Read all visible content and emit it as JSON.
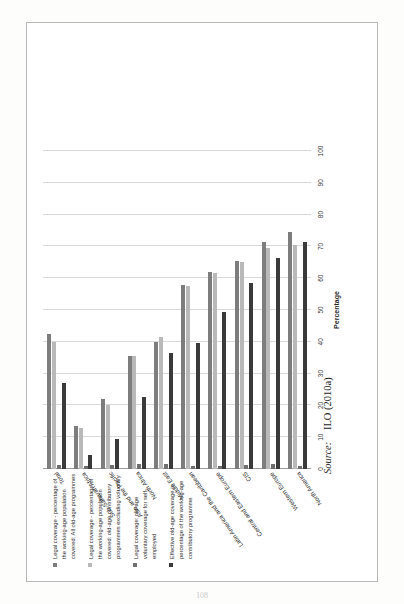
{
  "page": {
    "number": "108"
  },
  "source": {
    "lead": "Source:",
    "value": "ILO (2010a)"
  },
  "legend": {
    "items": [
      {
        "label": "Legal coverage - percentage of the working-age population covered: All old-age programmes",
        "color": "#7d7d7d",
        "name": "legend-item-all-old-age-programmes"
      },
      {
        "label": "Legal coverage - percentage of the working-age population covered: old-age contributory programmes excluding voluntary",
        "color": "#b9b9b9",
        "name": "legend-item-contributory-excluding-voluntary"
      },
      {
        "label": "Legal coverage: old-age voluntary coverage for self-employed",
        "color": "#6f6f6f",
        "name": "legend-item-voluntary-self-employed"
      },
      {
        "label": "Effective old-age coverage in percentage of the working-age contributory programme",
        "color": "#3a3a3a",
        "name": "legend-item-effective-coverage"
      }
    ]
  },
  "chart_data": {
    "type": "bar",
    "orientation": "horizontal",
    "title": "",
    "xlabel": "Percentage",
    "ylabel": "",
    "xlim": [
      0,
      100
    ],
    "xticks": [
      0,
      10,
      20,
      30,
      40,
      50,
      60,
      70,
      80,
      90,
      100
    ],
    "grid": true,
    "legend_position": "left",
    "categories": [
      "North America",
      "Western Europe",
      "CIS",
      "Central and Eastern Europe",
      "Latin America and the Caribbean",
      "Middle East",
      "North Africa",
      "Asia and the Pacific",
      "Sub-Saharan Africa",
      "Total"
    ],
    "series": [
      {
        "name": "Legal coverage - percentage of the working-age population covered: All old-age programmes",
        "color": "#7d7d7d",
        "values": [
          74.5,
          71.5,
          65.5,
          62.0,
          58.0,
          40.0,
          35.5,
          22.0,
          13.5,
          42.5
        ]
      },
      {
        "name": "Legal coverage - percentage of the working-age population covered: old-age contributory programmes excluding voluntary",
        "color": "#b9b9b9",
        "values": [
          70.5,
          69.5,
          65.0,
          61.5,
          57.5,
          41.5,
          35.5,
          20.0,
          13.0,
          40.0
        ]
      },
      {
        "name": "Legal coverage: old-age voluntary coverage for self-employed",
        "color": "#6f6f6f",
        "values": [
          0.8,
          1.5,
          1.2,
          1.0,
          0.8,
          1.6,
          1.5,
          1.2,
          0.9,
          1.2
        ]
      },
      {
        "name": "Effective old-age coverage in percentage of the working-age contributory programme",
        "color": "#3a3a3a",
        "values": [
          71.5,
          66.5,
          58.5,
          49.5,
          39.5,
          36.5,
          22.5,
          9.5,
          4.5,
          27.0
        ]
      }
    ]
  }
}
